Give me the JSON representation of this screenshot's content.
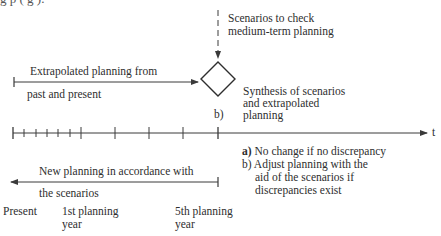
{
  "header_cut_text": "g                              p      (           g          ).",
  "scenarios_label": {
    "line1": "Scenarios to check",
    "line2": "medium-term planning"
  },
  "extrapolated_label": {
    "line1": "Extrapolated planning from",
    "line2": "past and present"
  },
  "synthesis_label": {
    "line1": "Synthesis of scenarios",
    "line2": "and extrapolated",
    "line3": "planning"
  },
  "diamond_marker": "b)",
  "axis_label": "t",
  "decision_notes": {
    "a_marker": "a)",
    "a_text": "No change if no discrepancy",
    "b_marker": "b)",
    "b_line1": "Adjust planning with the",
    "b_line2": "aid of the scenarios if",
    "b_line3": "discrepancies exist"
  },
  "new_planning_label": {
    "line1": "New planning in accordance with",
    "line2": "the scenarios"
  },
  "time_labels": {
    "present": "Present",
    "first_year_line1": "1st planning",
    "first_year_line2": "year",
    "fifth_year_line1": "5th planning",
    "fifth_year_line2": "year"
  },
  "colors": {
    "line": "#3a3a3a",
    "text": "#2e2e2e"
  }
}
